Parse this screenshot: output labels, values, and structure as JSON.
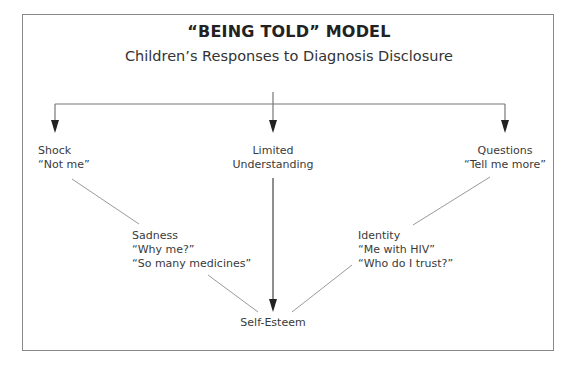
{
  "title": "“BEING TOLD” MODEL",
  "subtitle": "Children’s Responses to Diagnosis Disclosure",
  "nodes": {
    "shock": {
      "label": "Shock",
      "quote": "“Not me”"
    },
    "limited": {
      "line1": "Limited",
      "line2": "Understanding"
    },
    "questions": {
      "label": "Questions",
      "quote": "“Tell me more”"
    },
    "sadness": {
      "label": "Sadness",
      "quote1": "“Why me?”",
      "quote2": "“So many medicines”"
    },
    "identity": {
      "label": "Identity",
      "quote1": "“Me with HIV”",
      "quote2": "“Who do I trust?”"
    },
    "self_esteem": {
      "label": "Self-Esteem"
    }
  },
  "colors": {
    "frame": "#8a8a8a",
    "arrow": "#222222",
    "connector": "#9a9a9a"
  }
}
